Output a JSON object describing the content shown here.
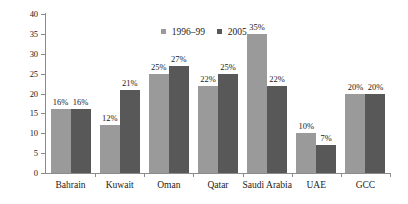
{
  "chart_data": {
    "type": "bar",
    "title": "",
    "subtitle": "",
    "xlabel": "",
    "ylabel": "",
    "ylim": [
      0,
      40
    ],
    "yticks": [
      0,
      5,
      10,
      15,
      20,
      25,
      30,
      35,
      40
    ],
    "ytick_labels": [
      "0",
      "5",
      "10",
      "15",
      "20",
      "25",
      "30",
      "35",
      "40"
    ],
    "grid": false,
    "legend_position": "top-center",
    "categories": [
      "Bahrain",
      "Kuwait",
      "Oman",
      "Qatar",
      "Saudi Arabia",
      "UAE",
      "GCC"
    ],
    "series": [
      {
        "name": "1996–99",
        "color": "#9a9a9a",
        "values": [
          16,
          12,
          25,
          22,
          35,
          10,
          20
        ],
        "labels": [
          "16%",
          "12%",
          "25%",
          "22%",
          "35%",
          "10%",
          "20%"
        ]
      },
      {
        "name": "2005",
        "color": "#585858",
        "values": [
          16,
          21,
          27,
          25,
          22,
          7,
          20
        ],
        "labels": [
          "16%",
          "21%",
          "27%",
          "25%",
          "22%",
          "7%",
          "20%"
        ]
      }
    ],
    "annotations": []
  },
  "legend": {
    "items": [
      {
        "label": "1996–99",
        "swatch": "legend-swatch-1996-99"
      },
      {
        "label": "2005",
        "swatch": "legend-swatch-2005"
      }
    ]
  },
  "colors": {
    "series_1996_99": "#9a9a9a",
    "series_2005": "#585858",
    "axis": "#8c8c8c",
    "text": "#1a1a1a",
    "background": "#ffffff"
  }
}
